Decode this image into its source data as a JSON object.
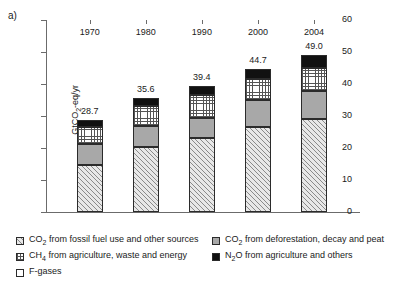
{
  "figure": {
    "panel_label": "a)"
  },
  "chart_data": {
    "type": "bar",
    "stacked": true,
    "title": "",
    "subtitle": "",
    "xlabel": "",
    "ylabel": "GtCO2-eq/yr",
    "ylabel_parts": {
      "pre": "GtCO",
      "sub": "2",
      "post": "-eq/yr"
    },
    "categories": [
      "1970",
      "1980",
      "1990",
      "2000",
      "2004"
    ],
    "ylim": [
      0,
      60
    ],
    "yticks": [
      0,
      10,
      20,
      30,
      40,
      50,
      60
    ],
    "ytick_labels": [
      "0",
      "10",
      "20",
      "30",
      "40",
      "50",
      "60"
    ],
    "grid": false,
    "legend_position": "below",
    "totals": [
      28.7,
      35.6,
      39.4,
      44.7,
      49.0
    ],
    "total_labels": [
      "28.7",
      "35.6",
      "39.4",
      "44.7",
      "49.0"
    ],
    "series": [
      {
        "name": "CO2 from fossil fuel use and other sources",
        "pattern": "diagonal-hatch",
        "color": "#e8e8e8",
        "values": [
          14.8,
          20.3,
          23.0,
          26.5,
          29.1
        ]
      },
      {
        "name": "CO2 from deforestation, decay and peat",
        "pattern": "solid-gray",
        "color": "#a8a8a8",
        "values": [
          6.3,
          6.5,
          6.5,
          8.5,
          8.8
        ]
      },
      {
        "name": "CH4 from agriculture, waste and energy",
        "pattern": "dot-grid",
        "color": "#ffffff",
        "values": [
          5.5,
          6.4,
          7.1,
          6.6,
          7.2
        ]
      },
      {
        "name": "N2O from agriculture and others",
        "pattern": "solid-black",
        "color": "#111111",
        "values": [
          2.1,
          2.4,
          2.8,
          3.1,
          3.9
        ]
      },
      {
        "name": "F-gases",
        "pattern": "white",
        "color": "#ffffff",
        "values": [
          0.0,
          0.0,
          0.0,
          0.0,
          0.0
        ]
      }
    ]
  },
  "legend": {
    "entries": [
      {
        "id": "co2-fossil",
        "pattern": "diagonal-hatch",
        "pre": "CO",
        "sub": "2",
        "post": " from fossil fuel use and other sources"
      },
      {
        "id": "co2-deforestation",
        "pattern": "solid-gray",
        "pre": "CO",
        "sub": "2",
        "post": " from deforestation, decay and peat"
      },
      {
        "id": "ch4-agriculture",
        "pattern": "dot-grid",
        "pre": "CH",
        "sub": "4",
        "post": " from agriculture, waste and energy"
      },
      {
        "id": "n2o-agriculture",
        "pattern": "solid-black",
        "pre": "N",
        "sub": "2",
        "post": "O from agriculture and others"
      },
      {
        "id": "f-gases",
        "pattern": "white",
        "pre": "F-gases",
        "sub": "",
        "post": ""
      }
    ]
  }
}
